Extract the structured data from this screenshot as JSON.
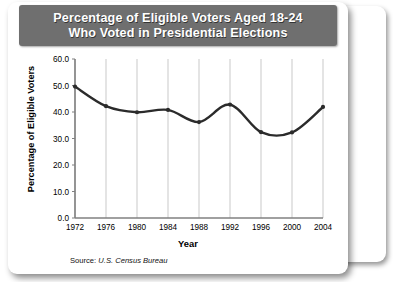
{
  "figure": {
    "title_line1": "Percentage of Eligible Voters Aged 18-24",
    "title_line2": "Who Voted in Presidential Elections",
    "source_label": "Source:",
    "source_name": "U.S. Census Bureau",
    "banner_color": "#6f6f6f",
    "line_color": "#2b2b2b",
    "grid_color": "#c9c9c9",
    "axis_color": "#808080"
  },
  "chart_data": {
    "type": "line",
    "title": "Percentage of Eligible Voters Aged 18-24 Who Voted in Presidential Elections",
    "xlabel": "Year",
    "ylabel": "Percentage of Eligible Voters",
    "x": [
      1972,
      1976,
      1980,
      1984,
      1988,
      1992,
      1996,
      2000,
      2004
    ],
    "values": [
      49.6,
      42.2,
      39.9,
      40.8,
      36.2,
      42.8,
      32.4,
      32.3,
      41.9
    ],
    "xtick_labels": [
      "1972",
      "1976",
      "1980",
      "1984",
      "1988",
      "1992",
      "1996",
      "2000",
      "2004"
    ],
    "ytick_labels": [
      "0.0",
      "10.0",
      "20.0",
      "30.0",
      "40.0",
      "50.0",
      "60.0"
    ],
    "ytick_values": [
      0,
      10,
      20,
      30,
      40,
      50,
      60
    ],
    "ylim": [
      0,
      60
    ],
    "xlim": [
      1972,
      2004
    ],
    "grid": "vertical",
    "legend": "none",
    "markers": true,
    "smoothing": "spline"
  }
}
